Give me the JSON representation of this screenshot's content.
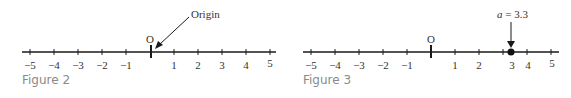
{
  "figure2": {
    "caption": "Figure 2",
    "origin_label": "O",
    "annotation": "Origin",
    "ticks": [
      "−5",
      "−4",
      "−3",
      "−2",
      "−1",
      "",
      "1",
      "2",
      "3",
      "4",
      "5"
    ]
  },
  "figure3": {
    "caption": "Figure 3",
    "origin_label": "O",
    "annotation_var": "a",
    "annotation_eq": " = 3.3",
    "point_value": 3.3,
    "ticks": [
      "−5",
      "−4",
      "−3",
      "−2",
      "−1",
      "",
      "1",
      "2",
      "3",
      "4",
      "5"
    ]
  },
  "colors": {
    "line": "#1a1a1a",
    "text": "#333333",
    "caption": "#8a8a8a"
  }
}
